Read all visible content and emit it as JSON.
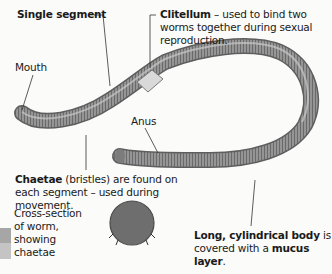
{
  "labels": {
    "single_segment": "Single segment",
    "clitellum_bold": "Clitellum",
    "clitellum_rest": " – used to bind two worms together during sexual reproduction.",
    "mouth": "Mouth",
    "anus": "Anus",
    "chaetae_bold": "Chaetae",
    "chaetae_rest": " (bristles) are found on each segment – used during movement.",
    "cross_section": "Cross-section of worm, showing chaetae",
    "body_bold": "Long, cylindrical body",
    "body_mid": " is covered with a ",
    "body_bold2": "mucus layer",
    "body_end": "."
  },
  "colors": {
    "worm_body": "#8f8f8f",
    "worm_dark": "#5a5a5a",
    "clitellum": "#d8d8d8",
    "cross_section": "#6e6e6e",
    "swatch_top": "#a6a6a6",
    "swatch_bottom": "#c4c4c4"
  }
}
